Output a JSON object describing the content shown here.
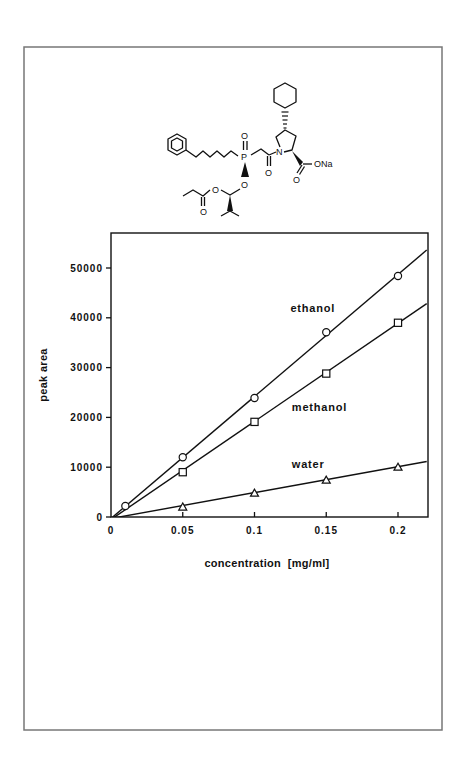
{
  "figure": {
    "frame_color": "#777777",
    "line_color": "#111111"
  },
  "structure": {
    "atom_labels": {
      "phosphoryl_o": "O",
      "phosphorus": "P",
      "amide_o": "O",
      "nitrogen": "N",
      "carboxyl_o": "O",
      "carboxylate": "ONa",
      "phosphinate_o": "O",
      "acetal_o": "O",
      "ester_o": "O"
    }
  },
  "chart_data": {
    "type": "scatter",
    "title": "",
    "xlabel": "concentration  [mg/ml]",
    "ylabel": "peak  area",
    "xlim": [
      0,
      0.22
    ],
    "ylim": [
      0,
      55000
    ],
    "grid": false,
    "legend_position": "inline labels",
    "x_ticks": [
      0,
      0.05,
      0.1,
      0.15,
      0.2
    ],
    "x_tick_labels": [
      "0",
      "0.05",
      "0.1",
      "0.15",
      "0.2"
    ],
    "y_ticks": [
      0,
      10000,
      20000,
      30000,
      40000,
      50000
    ],
    "y_tick_labels": [
      "0",
      "10000",
      "20000",
      "30000",
      "40000",
      "50000"
    ],
    "series": [
      {
        "name": "ethanol",
        "marker": "circle",
        "x": [
          0.01,
          0.05,
          0.1,
          0.15,
          0.2
        ],
        "values": [
          2200,
          12000,
          23900,
          37100,
          48400
        ],
        "fit_line": {
          "slope": 245000,
          "intercept": -300
        }
      },
      {
        "name": "methanol",
        "marker": "square",
        "x": [
          0.05,
          0.1,
          0.15,
          0.2
        ],
        "values": [
          9000,
          19100,
          28800,
          39000
        ],
        "fit_line": {
          "slope": 197000,
          "intercept": -500
        }
      },
      {
        "name": "water",
        "marker": "triangle",
        "x": [
          0.05,
          0.1,
          0.15,
          0.2
        ],
        "values": [
          2000,
          4800,
          7400,
          10000
        ],
        "fit_line": {
          "slope": 52000,
          "intercept": -300
        }
      }
    ],
    "annotations": [
      {
        "text": "ethanol",
        "x": 0.125,
        "y": 41200
      },
      {
        "text": "methanol",
        "x": 0.126,
        "y": 21300
      },
      {
        "text": "water",
        "x": 0.126,
        "y": 9900
      }
    ]
  }
}
